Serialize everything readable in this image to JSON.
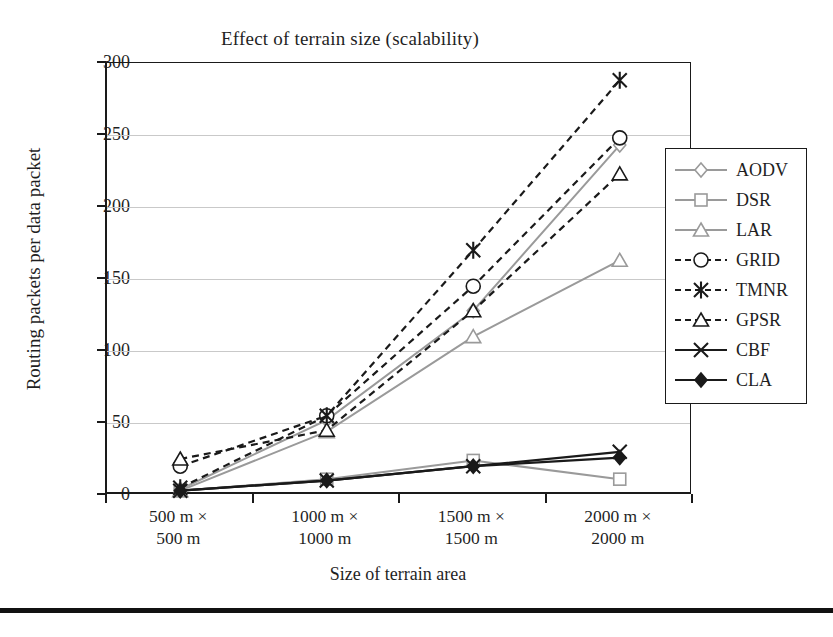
{
  "chart_data": {
    "type": "line",
    "title": "Effect of terrain size (scalability)",
    "xlabel": "Size of terrain area",
    "ylabel": "Routing packets per data packet",
    "categories": [
      "500 m ×\n500 m",
      "1000 m ×\n1000 m",
      "1500 m ×\n1500 m",
      "2000 m ×\n2000 m"
    ],
    "category_lines": [
      [
        "500 m ×",
        "500 m"
      ],
      [
        "1000 m ×",
        "1000 m"
      ],
      [
        "1500 m ×",
        "1500 m"
      ],
      [
        "2000 m ×",
        "2000 m"
      ]
    ],
    "ylim": [
      0,
      300
    ],
    "yticks": [
      0,
      50,
      100,
      150,
      200,
      250,
      300
    ],
    "ytick_labels": [
      "0",
      "50",
      "100",
      "150",
      "200",
      "250",
      "300"
    ],
    "grid": true,
    "legend_position": "right",
    "series": [
      {
        "name": "AODV",
        "marker": "diamond-open",
        "line": "solid",
        "color": "#9a9a9a",
        "values": [
          4,
          52,
          128,
          243
        ]
      },
      {
        "name": "DSR",
        "marker": "square-open",
        "line": "solid",
        "color": "#9a9a9a",
        "values": [
          3,
          11,
          24,
          11
        ]
      },
      {
        "name": "LAR",
        "marker": "triangle-open",
        "line": "solid",
        "color": "#9a9a9a",
        "values": [
          3,
          44,
          110,
          163
        ]
      },
      {
        "name": "GRID",
        "marker": "circle-open",
        "line": "dashed",
        "color": "#1a1a1a",
        "values": [
          20,
          55,
          145,
          248
        ]
      },
      {
        "name": "TMNR",
        "marker": "asterisk",
        "line": "dashed",
        "color": "#1a1a1a",
        "values": [
          5,
          55,
          170,
          288
        ]
      },
      {
        "name": "GPSR",
        "marker": "triangle-open",
        "line": "dashed",
        "color": "#1a1a1a",
        "values": [
          25,
          45,
          128,
          223
        ]
      },
      {
        "name": "CBF",
        "marker": "x-cross",
        "line": "solid",
        "color": "#1a1a1a",
        "values": [
          3,
          10,
          20,
          30
        ]
      },
      {
        "name": "CLA",
        "marker": "diamond-filled",
        "line": "solid",
        "color": "#1a1a1a",
        "values": [
          3,
          10,
          20,
          26
        ]
      }
    ]
  }
}
